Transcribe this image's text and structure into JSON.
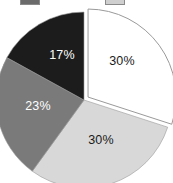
{
  "chart_data": {
    "type": "pie",
    "title": "",
    "subtitle": "",
    "xlabel": "",
    "ylabel": "",
    "grid": false,
    "legend_position": "top",
    "start_angle_deg": 0,
    "direction": "clockwise",
    "exploded_slice_index": 0,
    "categories": [
      "Series 1",
      "Series 2",
      "Series 3",
      "Series 4"
    ],
    "values": [
      30,
      30,
      23,
      17
    ],
    "labels": [
      "30%",
      "30%",
      "23%",
      "17%"
    ],
    "colors": [
      "#ffffff",
      "#d8d8d8",
      "#7a7a7a",
      "#1c1c1c"
    ],
    "slices": [
      {
        "label": "30%",
        "value": 30,
        "color": "#ffffff",
        "exploded": true,
        "label_color": "#1a1a1a",
        "label_x": 122,
        "label_y": 61
      },
      {
        "label": "30%",
        "value": 30,
        "color": "#d8d8d8",
        "exploded": false,
        "label_color": "#1a1a1a",
        "label_x": 101,
        "label_y": 140
      },
      {
        "label": "23%",
        "value": 23,
        "color": "#7a7a7a",
        "exploded": false,
        "label_color": "#ffffff",
        "label_x": 38,
        "label_y": 106
      },
      {
        "label": "17%",
        "value": 17,
        "color": "#1c1c1c",
        "exploded": false,
        "label_color": "#ffffff",
        "label_x": 62,
        "label_y": 55
      }
    ]
  },
  "legend": {
    "swatches": [
      {
        "name": "legend-swatch-dark",
        "color": "#6b6b6b"
      },
      {
        "name": "legend-swatch-light",
        "color": "#cfcfcf"
      }
    ]
  },
  "geometry": {
    "center_x": 84,
    "center_y": 100,
    "radius": 88,
    "explode_offset": 5,
    "outline_color": "#9a9a9a"
  }
}
